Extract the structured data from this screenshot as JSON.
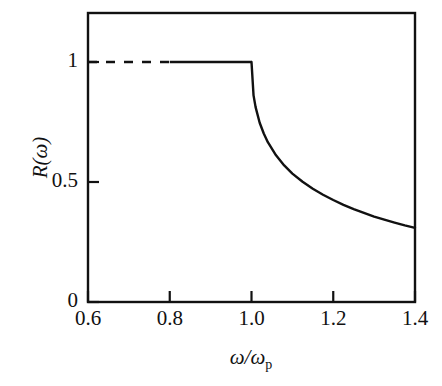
{
  "chart_data": {
    "type": "line",
    "title": "",
    "xlabel": "ω/ωp",
    "ylabel": "R(ω)",
    "xlim": [
      0.6,
      1.4
    ],
    "ylim": [
      0.0,
      1.21
    ],
    "grid": false,
    "legend": null,
    "xticks": [
      0.6,
      0.8,
      1.0,
      1.2,
      1.4
    ],
    "xtick_labels": [
      "0.6",
      "0.8",
      "1.0",
      "1.2",
      "1.4"
    ],
    "yticks": [
      0,
      0.5,
      1
    ],
    "ytick_labels": [
      "0",
      "0.5",
      "1"
    ],
    "series": [
      {
        "name": "R(ω) total-reflection plateau (dashed)",
        "style": "dashed",
        "x": [
          0.6,
          0.8
        ],
        "values": [
          1.0,
          1.0
        ]
      },
      {
        "name": "R(ω) total-reflection plateau (solid)",
        "style": "solid",
        "x": [
          0.8,
          1.0
        ],
        "values": [
          1.0,
          1.0
        ]
      },
      {
        "name": "R(ω) Drude reflectivity above plasma frequency",
        "style": "solid",
        "x": [
          1.0,
          1.005,
          1.01,
          1.02,
          1.03,
          1.04,
          1.06,
          1.08,
          1.1,
          1.125,
          1.15,
          1.175,
          1.2,
          1.225,
          1.25,
          1.275,
          1.3,
          1.325,
          1.35,
          1.375,
          1.4
        ],
        "values": [
          1.0,
          0.861,
          0.812,
          0.747,
          0.702,
          0.666,
          0.611,
          0.569,
          0.535,
          0.501,
          0.472,
          0.447,
          0.425,
          0.405,
          0.387,
          0.371,
          0.356,
          0.343,
          0.331,
          0.319,
          0.309
        ]
      }
    ],
    "annotations": [
      {
        "text": "Sharp reflectivity edge at ω/ωp = 1.0",
        "x": 1.0,
        "y": 1.0
      }
    ],
    "axis_style": {
      "frame": "box",
      "tick_direction": "in",
      "line_color": "#111111",
      "line_width_px": 2
    }
  },
  "labels": {
    "xtick_0": "0.6",
    "xtick_1": "0.8",
    "xtick_2": "1.0",
    "xtick_3": "1.2",
    "xtick_4": "1.4",
    "ytick_0": "0",
    "ytick_1": "0.5",
    "ytick_2": "1",
    "xaxis_title_main": "ω/ω",
    "xaxis_title_sub": "p",
    "yaxis_title": "R(ω)"
  },
  "colors": {
    "background": "#ffffff",
    "ink": "#111111",
    "curve": "#111111"
  }
}
